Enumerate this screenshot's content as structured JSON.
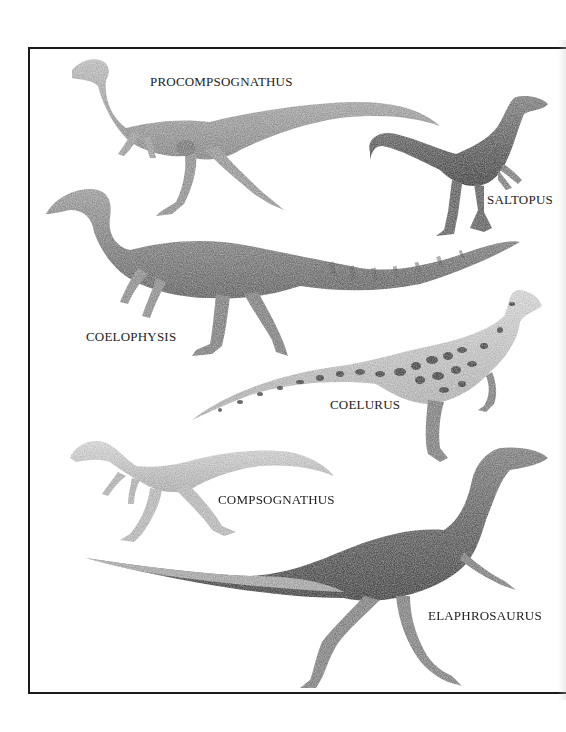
{
  "plate": {
    "border_color": "#1a1a1a",
    "background": "#ffffff"
  },
  "dinosaurs": [
    {
      "id": "procompsognathus",
      "label": "PROCOMPSOGNATHUS",
      "label_pos": {
        "x": 150,
        "y": 75
      },
      "tone": "#9a9a9a"
    },
    {
      "id": "saltopus",
      "label": "SALTOPUS",
      "label_pos": {
        "x": 487,
        "y": 193
      },
      "tone": "#6f6f6f"
    },
    {
      "id": "coelophysis",
      "label": "COELOPHYSIS",
      "label_pos": {
        "x": 86,
        "y": 330
      },
      "tone": "#7d7d7d"
    },
    {
      "id": "coelurus",
      "label": "COELURUS",
      "label_pos": {
        "x": 330,
        "y": 398
      },
      "tone": "#5a5a5a"
    },
    {
      "id": "compsognathus",
      "label": "COMPSOGNATHUS",
      "label_pos": {
        "x": 218,
        "y": 493
      },
      "tone": "#b5b5b5"
    },
    {
      "id": "elaphrosaurus",
      "label": "ELAPHROSAURUS",
      "label_pos": {
        "x": 428,
        "y": 609
      },
      "tone": "#6a6a6a"
    }
  ]
}
